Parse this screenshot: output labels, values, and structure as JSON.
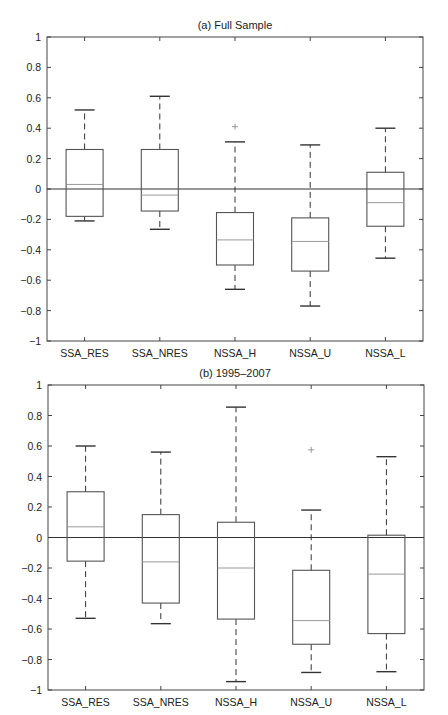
{
  "chart_data": [
    {
      "type": "box",
      "title": "(a) Full Sample",
      "xlabel": "",
      "ylabel": "",
      "ylim": [
        -1,
        1
      ],
      "yticks": [
        -1,
        -0.8,
        -0.6,
        -0.4,
        -0.2,
        0,
        0.2,
        0.4,
        0.6,
        0.8,
        1
      ],
      "ytick_labels": [
        "−1",
        "−0.8",
        "−0.6",
        "−0.4",
        "−0.2",
        "0",
        "0.2",
        "0.4",
        "0.6",
        "0.8",
        "1"
      ],
      "grid": false,
      "reference_line": 0,
      "categories": [
        "SSA_RES",
        "SSA_NRES",
        "NSSA_H",
        "NSSA_U",
        "NSSA_L"
      ],
      "boxes": [
        {
          "label": "SSA_RES",
          "whisker_low": -0.21,
          "q1": -0.18,
          "median": 0.03,
          "q3": 0.26,
          "whisker_high": 0.52,
          "outliers": []
        },
        {
          "label": "SSA_NRES",
          "whisker_low": -0.265,
          "q1": -0.145,
          "median": -0.04,
          "q3": 0.26,
          "whisker_high": 0.61,
          "outliers": []
        },
        {
          "label": "NSSA_H",
          "whisker_low": -0.66,
          "q1": -0.5,
          "median": -0.335,
          "q3": -0.155,
          "whisker_high": 0.31,
          "outliers": [
            0.41
          ]
        },
        {
          "label": "NSSA_U",
          "whisker_low": -0.77,
          "q1": -0.54,
          "median": -0.345,
          "q3": -0.19,
          "whisker_high": 0.29,
          "outliers": []
        },
        {
          "label": "NSSA_L",
          "whisker_low": -0.455,
          "q1": -0.245,
          "median": -0.09,
          "q3": 0.11,
          "whisker_high": 0.4,
          "outliers": []
        }
      ]
    },
    {
      "type": "box",
      "title": "(b) 1995–2007",
      "xlabel": "",
      "ylabel": "",
      "ylim": [
        -1,
        1
      ],
      "yticks": [
        -1,
        -0.8,
        -0.6,
        -0.4,
        -0.2,
        0,
        0.2,
        0.4,
        0.6,
        0.8,
        1
      ],
      "ytick_labels": [
        "−1",
        "−0.8",
        "−0.6",
        "−0.4",
        "−0.2",
        "0",
        "0.2",
        "0.4",
        "0.6",
        "0.8",
        "1"
      ],
      "grid": false,
      "reference_line": 0,
      "categories": [
        "SSA_RES",
        "SSA_NRES",
        "NSSA_H",
        "NSSA_U",
        "NSSA_L"
      ],
      "boxes": [
        {
          "label": "SSA_RES",
          "whisker_low": -0.53,
          "q1": -0.155,
          "median": 0.07,
          "q3": 0.3,
          "whisker_high": 0.6,
          "outliers": []
        },
        {
          "label": "SSA_NRES",
          "whisker_low": -0.565,
          "q1": -0.43,
          "median": -0.16,
          "q3": 0.15,
          "whisker_high": 0.56,
          "outliers": []
        },
        {
          "label": "NSSA_H",
          "whisker_low": -0.945,
          "q1": -0.535,
          "median": -0.2,
          "q3": 0.1,
          "whisker_high": 0.855,
          "outliers": []
        },
        {
          "label": "NSSA_U",
          "whisker_low": -0.885,
          "q1": -0.7,
          "median": -0.545,
          "q3": -0.215,
          "whisker_high": 0.18,
          "outliers": [
            0.575
          ]
        },
        {
          "label": "NSSA_L",
          "whisker_low": -0.88,
          "q1": -0.63,
          "median": -0.24,
          "q3": 0.015,
          "whisker_high": 0.53,
          "outliers": []
        }
      ]
    }
  ],
  "style": {
    "axis_color": "#444444",
    "box_color": "#555555",
    "median_color": "#999999",
    "whisker_color": "#333333",
    "outlier_color": "#999999",
    "zero_line_color": "#333333"
  }
}
